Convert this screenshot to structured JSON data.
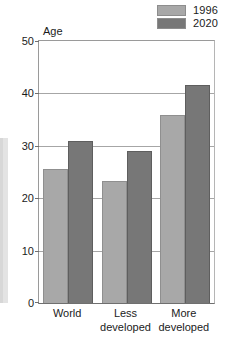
{
  "chart_data": {
    "type": "bar",
    "title": "",
    "xlabel": "",
    "ylabel": "Age",
    "ylim": [
      0,
      50
    ],
    "yticks": [
      0,
      10,
      20,
      30,
      40,
      50
    ],
    "grid": true,
    "legend_position": "top-right",
    "categories": [
      "World",
      "Less\ndeveloped",
      "More\ndeveloped"
    ],
    "series": [
      {
        "name": "1996",
        "color": "#a8a8a8",
        "values": [
          25.5,
          23.2,
          35.9
        ]
      },
      {
        "name": "2020",
        "color": "#777777",
        "values": [
          30.9,
          29.1,
          41.6
        ]
      }
    ]
  },
  "legend": {
    "items": [
      {
        "label": "1996",
        "swatch": "legend-swatch-1996"
      },
      {
        "label": "2020",
        "swatch": "legend-swatch-2020"
      }
    ]
  },
  "axes": {
    "y_title": "Age",
    "y_tick_labels": [
      "50",
      "40",
      "30",
      "20",
      "10",
      "0"
    ],
    "x_tick_labels": [
      "World",
      "Less\ndeveloped",
      "More\ndeveloped"
    ]
  },
  "colors": {
    "series_1996": "#a8a8a8",
    "series_2020": "#777777",
    "gridline": "#a6a6a6",
    "axis": "#6f6f6f",
    "text": "#1b1b1b",
    "background": "#ffffff"
  }
}
